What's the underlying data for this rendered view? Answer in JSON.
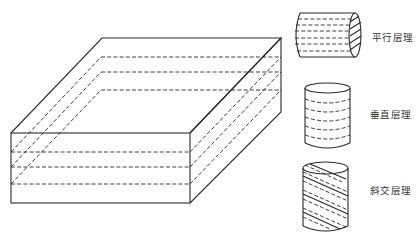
{
  "diagram": {
    "title": "",
    "block": {
      "name": "layered-rock-block",
      "layers": 4
    },
    "samples": [
      {
        "id": "parallel",
        "label": "平行层理",
        "orientation": "horizontal-cylinder"
      },
      {
        "id": "vertical",
        "label": "垂直层理",
        "orientation": "vertical-cylinder"
      },
      {
        "id": "oblique",
        "label": "斜交层理",
        "orientation": "oblique-cylinder"
      }
    ],
    "colors": {
      "line": "#2a2a2a",
      "text": "#333333",
      "background": "#ffffff"
    }
  }
}
